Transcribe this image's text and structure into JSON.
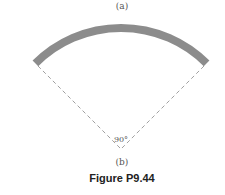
{
  "figure": {
    "label_a": "(a)",
    "label_b": "(b)",
    "angle_label": "90°",
    "caption": "Figure P9.44"
  },
  "geometry": {
    "apex": [
      121,
      149
    ],
    "arc_radius": 121,
    "arc_band_width": 8,
    "arc_span_degrees": 90,
    "arc_color": "#8c8c8c",
    "dash_color": "#888888"
  }
}
